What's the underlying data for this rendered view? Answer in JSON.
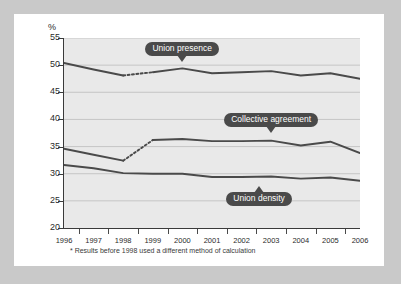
{
  "figure": {
    "y_axis_title": "%",
    "footnote": "* Results before 1998 used a different method of calculation"
  },
  "callouts": [
    {
      "id": "union-presence",
      "label": "Union presence",
      "direction": "down",
      "x_year": 2000,
      "y_value": 52.9
    },
    {
      "id": "collective-agreement",
      "label": "Collective agreement",
      "direction": "down",
      "x_year": 2003,
      "y_value": 39.9
    },
    {
      "id": "union-density",
      "label": "Union density",
      "direction": "up",
      "x_year": 2002.6,
      "y_value": 25.4
    }
  ],
  "chart_data": {
    "type": "line",
    "title": "",
    "xlabel": "",
    "ylabel": "%",
    "xlim": [
      1996,
      2006
    ],
    "ylim": [
      20,
      55
    ],
    "yticks": [
      20,
      25,
      30,
      35,
      40,
      45,
      50,
      55
    ],
    "grid": "horizontal",
    "legend": "annotations",
    "x": [
      1996,
      1997,
      1998,
      1999,
      2000,
      2001,
      2002,
      2003,
      2004,
      2005,
      2006
    ],
    "series": [
      {
        "name": "Union presence",
        "color": "#4a4a4a",
        "dashed_segment": [
          1998,
          1999
        ],
        "values": [
          50.4,
          49.2,
          48.1,
          48.7,
          49.4,
          48.5,
          48.7,
          48.9,
          48.1,
          48.5,
          47.5
        ]
      },
      {
        "name": "Collective agreement",
        "color": "#4a4a4a",
        "dashed_segment": [
          1998,
          1999
        ],
        "values": [
          34.6,
          33.5,
          32.4,
          36.2,
          36.4,
          36.0,
          36.0,
          36.1,
          35.2,
          35.9,
          33.8
        ]
      },
      {
        "name": "Union density",
        "color": "#4a4a4a",
        "dashed_segment": null,
        "values": [
          31.6,
          31.0,
          30.1,
          30.0,
          30.0,
          29.4,
          29.4,
          29.5,
          29.1,
          29.3,
          28.7
        ]
      }
    ],
    "notes": "* Results before 1998 used a different method of calculation"
  }
}
